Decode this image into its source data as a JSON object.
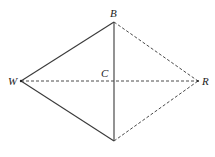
{
  "diagram": {
    "type": "geometry-kite",
    "points": {
      "B": {
        "label": "B",
        "x": 114,
        "y": 22
      },
      "W": {
        "label": "W",
        "x": 21,
        "y": 81
      },
      "R": {
        "label": "R",
        "x": 198,
        "y": 81
      },
      "C": {
        "label": "C",
        "x": 114,
        "y": 81
      },
      "D": {
        "label": "",
        "x": 114,
        "y": 141
      }
    },
    "segments": [
      {
        "from": "W",
        "to": "B",
        "style": "solid"
      },
      {
        "from": "W",
        "to": "D",
        "style": "solid"
      },
      {
        "from": "B",
        "to": "D",
        "style": "solid"
      },
      {
        "from": "W",
        "to": "R",
        "style": "dashed"
      },
      {
        "from": "B",
        "to": "R",
        "style": "dashed"
      },
      {
        "from": "D",
        "to": "R",
        "style": "dashed"
      }
    ],
    "colors": {
      "line": "#3a3a3a",
      "text": "#222222",
      "background": "#ffffff"
    }
  }
}
